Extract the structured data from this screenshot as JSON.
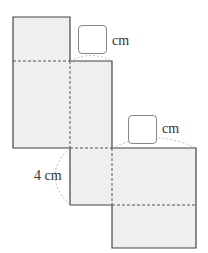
{
  "figure": {
    "type": "net-of-rectangular-prism",
    "fill_color": "#efefef",
    "stroke_color": "#444444",
    "labels": {
      "top_unit": "cm",
      "right_unit": "cm",
      "left_dimension": "4 cm"
    },
    "answer_boxes": [
      {
        "value": "",
        "unit": "cm"
      },
      {
        "value": "",
        "unit": "cm"
      }
    ]
  }
}
